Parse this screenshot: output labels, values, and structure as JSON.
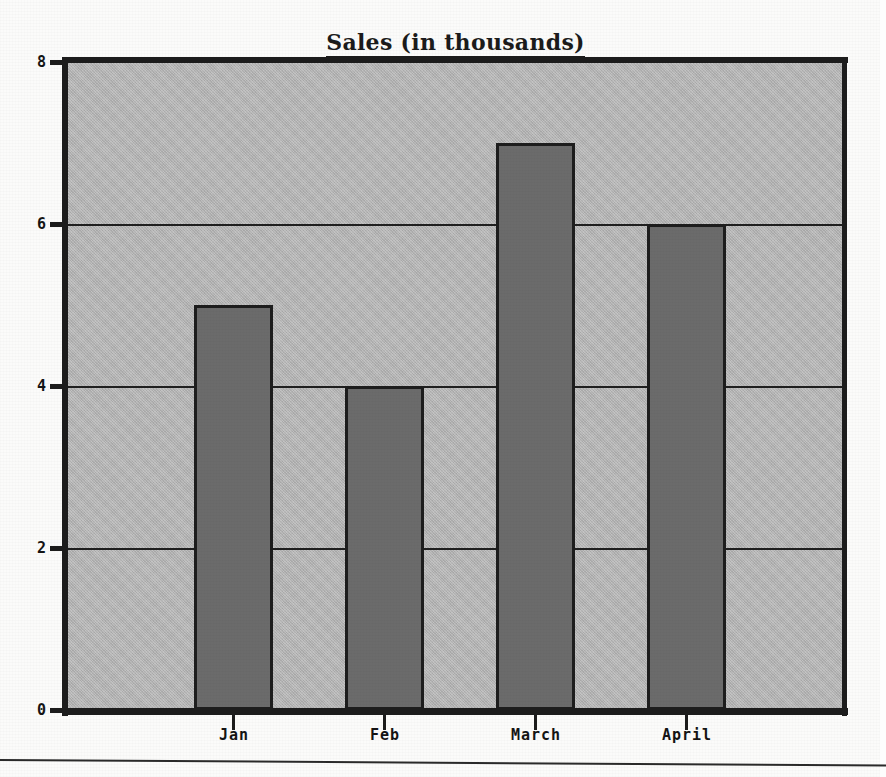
{
  "figure": {
    "title": "Sales (in thousands)",
    "title_underlined": true
  },
  "axes": {
    "y_ticks": [
      "8",
      "6",
      "4",
      "2",
      "0"
    ],
    "x_ticks": [
      "Jan",
      "Feb",
      "March",
      "April"
    ]
  },
  "colors": {
    "plot_background": "#b3b3b3",
    "bar_fill": "#6b6b6b",
    "bar_outline": "#1d1d1d",
    "axis": "#1c1c1c",
    "text": "#141414",
    "page_background": "#fbfbfa"
  },
  "chart_data": {
    "type": "bar",
    "title": "Sales (in thousands)",
    "categories": [
      "Jan",
      "Feb",
      "March",
      "April"
    ],
    "values": [
      5,
      4,
      7,
      6
    ],
    "xlabel": "",
    "ylabel": "",
    "ylim": [
      0,
      8
    ],
    "ytick_values": [
      0,
      2,
      4,
      6,
      8
    ],
    "grid": true,
    "gridlines_at": [
      2,
      4,
      6
    ],
    "legend": null,
    "legend_position": "none",
    "series": [
      {
        "name": "Sales",
        "values": [
          5,
          4,
          7,
          6
        ]
      }
    ]
  }
}
